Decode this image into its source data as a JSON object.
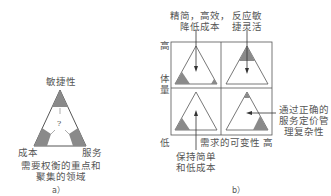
{
  "panel_a": {
    "top_label": "敏捷性",
    "left_label": "成本",
    "right_label": "服务",
    "center_mark": "?",
    "caption_line1": "需要权衡的重点和",
    "caption_line2": "聚集的领域",
    "sub_label": "a）"
  },
  "panel_b": {
    "y_axis": {
      "high": "高",
      "label_line1": "体",
      "label_line2": "量",
      "low": "低"
    },
    "x_axis": {
      "label": "需求的可变性",
      "high": "高"
    },
    "annotations": {
      "top_left_line1": "精简，高效，",
      "top_left_line2": "降低成本",
      "top_right_line1": "反应敏",
      "top_right_line2": "捷灵活",
      "right_line1": "通过正确的",
      "right_line2": "服务定价管",
      "right_line3": "理复杂性",
      "bottom_line1": "保持简单",
      "bottom_line2": "和低成本"
    },
    "sub_label": "b）"
  },
  "colors": {
    "fill": "#8a8a8a",
    "line": "#555555",
    "text": "#555555"
  }
}
